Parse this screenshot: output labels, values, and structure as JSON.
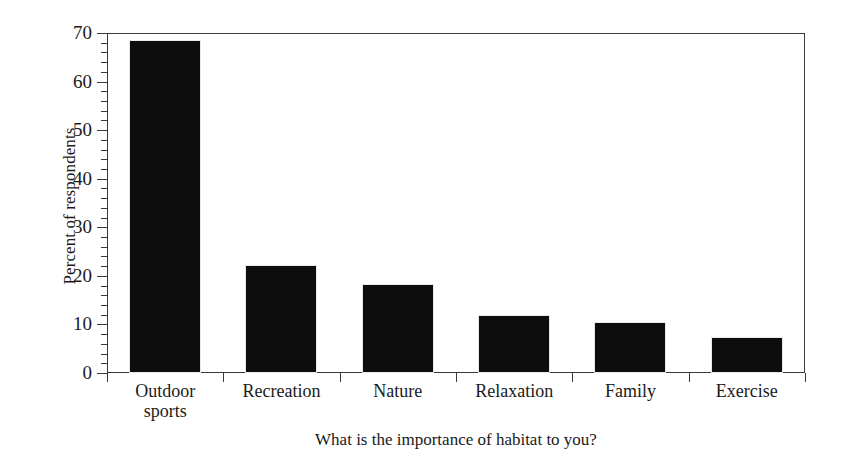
{
  "chart_data": {
    "type": "bar",
    "title": "",
    "categories": [
      "Outdoor sports",
      "Recreation",
      "Nature",
      "Relaxation",
      "Family",
      "Exercise"
    ],
    "category_lines": [
      [
        "Outdoor",
        "sports"
      ],
      [
        "Recreation"
      ],
      [
        "Nature"
      ],
      [
        "Relaxation"
      ],
      [
        "Family"
      ],
      [
        "Exercise"
      ]
    ],
    "values": [
      68.5,
      22.2,
      18.4,
      12.0,
      10.5,
      7.4
    ],
    "xlabel": "What is the importance of habitat to you?",
    "ylabel": "Percent of respondents",
    "ylim": [
      0,
      70
    ],
    "xlim_categories": 6,
    "y_major_ticks": [
      0,
      10,
      20,
      30,
      40,
      50,
      60,
      70
    ],
    "y_minor_tick_step": 2,
    "y_tick_labels": [
      "0",
      "10",
      "20",
      "30",
      "40",
      "50",
      "60",
      "70"
    ],
    "grid": false,
    "legend": null,
    "bar_color": "#0d0d0d",
    "axis_color": "#3a3a3a",
    "background_color": "#ffffff"
  }
}
